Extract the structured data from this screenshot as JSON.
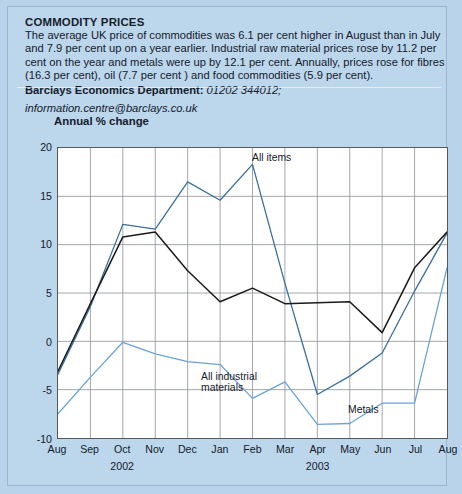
{
  "article": {
    "title": "COMMODITY PRICES",
    "body": "The average UK price of commodities was 6.1 per cent higher in August than in July and 7.9 per cent up on a year earlier. Industrial raw material prices rose by 11.2 per cent on the year and metals were up by 12.1 per cent. Annually, prices rose for fibres (16.3 per cent), oil (7.7 per cent ) and food commodities (5.9 per cent).",
    "department_label": "Barclays Economics Department:",
    "department_phone": "01202 344012;",
    "email": "information.centre@barclays.co.uk"
  },
  "chart_data": {
    "type": "line",
    "title": "",
    "axis_title": "Annual % change",
    "xlabel": "",
    "ylabel": "Annual % change",
    "ylim": [
      -10,
      20
    ],
    "yticks": [
      20,
      15,
      10,
      5,
      0,
      -5,
      -10
    ],
    "grid": true,
    "legend": "inline-annotations",
    "categories": [
      "Aug",
      "Sep",
      "Oct",
      "Nov",
      "Dec",
      "Jan",
      "Feb",
      "Mar",
      "Apr",
      "May",
      "Jun",
      "Jul",
      "Aug"
    ],
    "year_groups": [
      {
        "label": "2002",
        "at_category": "Oct"
      },
      {
        "label": "2003",
        "at_category": "Apr"
      }
    ],
    "series": [
      {
        "name": "All items",
        "color": "#3a6f9f",
        "values": [
          -3.4,
          3.6,
          12.1,
          11.6,
          16.5,
          14.6,
          18.3,
          6.0,
          -5.5,
          -3.6,
          -1.2,
          5.2,
          11.2
        ]
      },
      {
        "name": "All industrial materials",
        "color": "#1a1a1a",
        "values": [
          -3.1,
          3.9,
          10.8,
          11.3,
          7.3,
          4.1,
          5.5,
          3.9,
          4.0,
          4.1,
          0.9,
          7.6,
          11.3
        ]
      },
      {
        "name": "Metals",
        "color": "#6ba3d6",
        "values": [
          -7.5,
          -3.7,
          -0.1,
          -1.3,
          -2.1,
          -2.4,
          -5.9,
          -4.2,
          -8.6,
          -8.5,
          -6.4,
          -6.4,
          7.6
        ]
      }
    ],
    "annotations": [
      {
        "text": "All items",
        "series": "All items"
      },
      {
        "text": "All industrial",
        "series": "All industrial materials"
      },
      {
        "text": "materials",
        "series": "All industrial materials"
      },
      {
        "text": "Metals",
        "series": "Metals"
      }
    ]
  }
}
